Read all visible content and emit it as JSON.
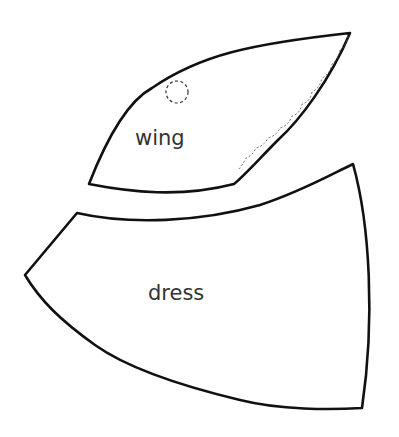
{
  "pieces": [
    {
      "id": "wing",
      "label": "wing",
      "markings": [
        "dashed-circle",
        "scalloped-stitch-edge"
      ]
    },
    {
      "id": "dress",
      "label": "dress"
    }
  ],
  "colors": {
    "outline": "#111111",
    "background": "#ffffff"
  }
}
